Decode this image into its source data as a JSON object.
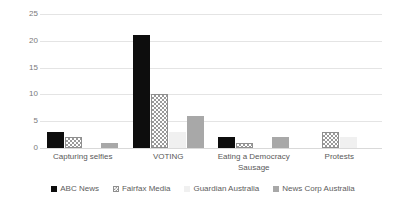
{
  "chart_data": {
    "type": "bar",
    "title": "",
    "subtitle": "",
    "xlabel": "",
    "ylabel": "",
    "ylim": [
      0,
      25
    ],
    "ytick_labels": [
      "0",
      "5",
      "10",
      "15",
      "20",
      "25"
    ],
    "ytick_values": [
      0,
      5,
      10,
      15,
      20,
      25
    ],
    "grid": true,
    "legend_position": "bottom",
    "categories": [
      "Capturing selfies",
      "VOTING",
      "Eating a Democracy Sausage",
      "Protests"
    ],
    "series": [
      {
        "name": "ABC News",
        "color": "#0d0d0d",
        "values": [
          3,
          21,
          2,
          0
        ]
      },
      {
        "name": "Fairfax Media",
        "color": "#ffffff",
        "values": [
          2,
          10,
          1,
          3
        ]
      },
      {
        "name": "Guardian Australia",
        "color": "#f0f0f0",
        "values": [
          0,
          3,
          0,
          2
        ]
      },
      {
        "name": "News Corp Australia",
        "color": "#a8a8a8",
        "values": [
          1,
          6,
          2,
          0
        ]
      }
    ]
  }
}
